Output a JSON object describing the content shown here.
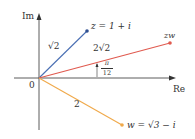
{
  "axes": {
    "imag_label": "Im",
    "real_label": "Re",
    "origin_label": "0"
  },
  "points": {
    "z": {
      "label": "z = 1 + i",
      "color": "#4a6fb3"
    },
    "zw": {
      "label": "zw",
      "color": "#e05a4f"
    },
    "w": {
      "label": "w = √3 − i",
      "color": "#f0a94a"
    }
  },
  "segments": {
    "z_modulus": "√2",
    "zw_modulus": "2√2",
    "w_modulus": "2"
  },
  "angle": {
    "numerator": "π",
    "denominator": "12"
  }
}
